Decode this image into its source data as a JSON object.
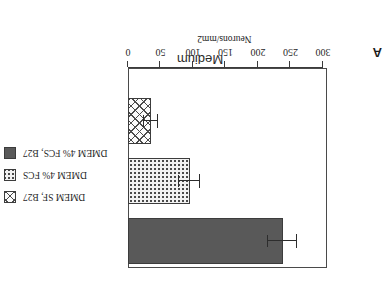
{
  "figure": {
    "panel_letter": "A",
    "rotation_degrees": 180
  },
  "chart_data": {
    "type": "bar",
    "title": "Medium",
    "xlabel": "Medium",
    "ylabel": "Neurons/mm2",
    "ylim": [
      0,
      300
    ],
    "yticks": [
      0,
      50,
      100,
      150,
      200,
      250,
      300
    ],
    "ytick_labels": [
      "0",
      "50",
      "100",
      "150",
      "200",
      "250",
      "300"
    ],
    "grid": false,
    "orientation": "vertical",
    "legend_position": "left-outside",
    "categories": [
      "DMEM 4% FCS, B27",
      "DMEM 4% FCS",
      "DMEM SF, B27"
    ],
    "values": [
      238,
      95,
      35
    ],
    "errors": [
      22,
      16,
      11
    ],
    "bars": [
      {
        "label": "DMEM 4% FCS, B27",
        "value": 238,
        "error": 22,
        "fill": "solid-gray",
        "color": "#595959"
      },
      {
        "label": "DMEM 4% FCS",
        "value": 95,
        "error": 16,
        "fill": "dots",
        "color": "#f2f2f2"
      },
      {
        "label": "DMEM SF, B27",
        "value": 35,
        "error": 11,
        "fill": "crosshatch",
        "color": "#fbfbfb"
      }
    ],
    "series": [
      {
        "name": "Neurons/mm2",
        "values": [
          238,
          95,
          35
        ]
      }
    ]
  },
  "legend": {
    "items": [
      {
        "label": "DMEM SF, B27",
        "fill": "crosshatch"
      },
      {
        "label": "DMEM 4% FCS",
        "fill": "dots"
      },
      {
        "label": "DMEM 4% FCS, B27",
        "fill": "solid-gray"
      }
    ]
  },
  "axis": {
    "title": "Neurons/mm2",
    "ticks": [
      "0",
      "50",
      "100",
      "150",
      "200",
      "250",
      "300"
    ]
  },
  "colors": {
    "bar_solid": "#595959",
    "bar_dots_bg": "#f2f2f2",
    "bar_hatch_bg": "#fbfbfb",
    "outline": "#3c3c3c",
    "axis": "#3b3b3b",
    "text": "#1f1f1f",
    "background": "#ffffff"
  }
}
